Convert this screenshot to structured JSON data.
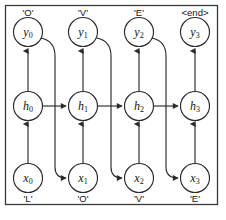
{
  "figure": {
    "frame_color": "#3a3a3a",
    "stroke_color": "#2b2b2b",
    "background": "#ffffff"
  },
  "rows": {
    "output_row": {
      "name": "output",
      "symbol": "y",
      "nodes": [
        {
          "base": "y",
          "sub": "0"
        },
        {
          "base": "y",
          "sub": "1"
        },
        {
          "base": "y",
          "sub": "2"
        },
        {
          "base": "y",
          "sub": "3"
        }
      ]
    },
    "hidden_row": {
      "name": "hidden",
      "symbol": "h",
      "nodes": [
        {
          "base": "h",
          "sub": "0"
        },
        {
          "base": "h",
          "sub": "1"
        },
        {
          "base": "h",
          "sub": "2"
        },
        {
          "base": "h",
          "sub": "3"
        }
      ]
    },
    "input_row": {
      "name": "input",
      "symbol": "x",
      "nodes": [
        {
          "base": "x",
          "sub": "0"
        },
        {
          "base": "x",
          "sub": "1"
        },
        {
          "base": "x",
          "sub": "2"
        },
        {
          "base": "x",
          "sub": "3"
        }
      ]
    }
  },
  "top_labels": [
    "'O'",
    "'V'",
    "'E'",
    "<end>"
  ],
  "bottom_labels": [
    "'L'",
    "'O'",
    "'V'",
    "'E'"
  ],
  "sequence": {
    "input_string": "LOVE",
    "output_string": "OVE<end>",
    "timesteps": 4
  },
  "edges": {
    "input_to_hidden_label": "x-to-h",
    "hidden_to_output_label": "h-to-y",
    "hidden_to_hidden_label": "h-to-h-recurrent",
    "output_to_next_input_label": "y-to-next-x-feedback"
  }
}
